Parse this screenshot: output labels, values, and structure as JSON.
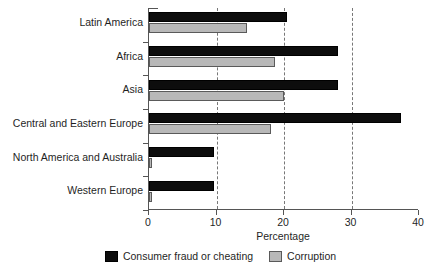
{
  "chart_data": {
    "type": "bar",
    "orientation": "horizontal",
    "title": "",
    "xlabel": "Percentage",
    "ylabel": "",
    "xlim": [
      0,
      40
    ],
    "xticks": [
      0,
      10,
      20,
      30,
      40
    ],
    "xtick_labels": [
      "0",
      "10",
      "20",
      "30",
      "40"
    ],
    "grid": "vertical-dashed",
    "legend_position": "bottom-center",
    "categories": [
      "Latin America",
      "Africa",
      "Asia",
      "Central and Eastern Europe",
      "North America and Australia",
      "Western Europe"
    ],
    "series": [
      {
        "name": "Consumer fraud or cheating",
        "color": "#0d0d0d",
        "values": [
          20.4,
          28.0,
          28.0,
          37.3,
          9.7,
          9.7
        ]
      },
      {
        "name": "Corruption",
        "color": "#b8b8b8",
        "values": [
          14.5,
          18.7,
          20.0,
          18.0,
          0.5,
          0.5
        ]
      }
    ]
  },
  "axis": {
    "x_title": "Percentage"
  },
  "legend": {
    "items": [
      {
        "label": "Consumer fraud or cheating",
        "swatch": "dark"
      },
      {
        "label": "Corruption",
        "swatch": "light"
      }
    ]
  }
}
